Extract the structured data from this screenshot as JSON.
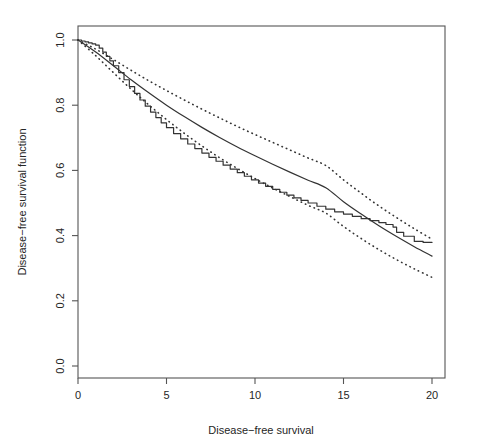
{
  "figure": {
    "title": "",
    "background_color": "#ffffff",
    "foreground_color": "#1a1a1a"
  },
  "axes": {
    "x_title": "Disease−free survival",
    "y_title": "Disease−free survival function",
    "x_ticks": [
      "0",
      "5",
      "10",
      "15",
      "20"
    ],
    "y_ticks": [
      "0.0",
      "0.2",
      "0.4",
      "0.6",
      "0.8",
      "1.0"
    ]
  },
  "chart_data": {
    "type": "line",
    "title": "",
    "xlabel": "Disease−free survival",
    "ylabel": "Disease−free survival function",
    "xlim": [
      0,
      20
    ],
    "ylim": [
      0.0,
      1.0
    ],
    "xticks": [
      0,
      5,
      10,
      15,
      20
    ],
    "yticks": [
      0.0,
      0.2,
      0.4,
      0.6,
      0.8,
      1.0
    ],
    "grid": false,
    "legend": "none",
    "box": true,
    "series": [
      {
        "name": "Kaplan-Meier empirical survival",
        "style": "solid-step",
        "color": "#333333",
        "x": [
          0.0,
          0.2,
          0.4,
          0.6,
          0.8,
          1.0,
          1.2,
          1.4,
          1.6,
          1.8,
          2.0,
          2.3,
          2.6,
          2.9,
          3.2,
          3.5,
          3.8,
          4.1,
          4.4,
          4.7,
          5.0,
          5.4,
          5.8,
          6.2,
          6.6,
          7.0,
          7.4,
          7.8,
          8.2,
          8.6,
          9.0,
          9.4,
          9.8,
          10.2,
          10.6,
          11.0,
          11.4,
          11.8,
          12.2,
          12.6,
          13.0,
          13.5,
          14.0,
          14.5,
          15.0,
          15.5,
          16.0,
          16.5,
          17.0,
          17.4,
          17.8,
          18.0,
          18.4,
          19.0,
          19.5,
          20.0
        ],
        "y": [
          1.0,
          0.997,
          0.994,
          0.991,
          0.988,
          0.984,
          0.975,
          0.963,
          0.95,
          0.936,
          0.921,
          0.9,
          0.878,
          0.857,
          0.836,
          0.816,
          0.797,
          0.779,
          0.762,
          0.746,
          0.731,
          0.713,
          0.697,
          0.681,
          0.667,
          0.653,
          0.64,
          0.628,
          0.616,
          0.604,
          0.593,
          0.582,
          0.571,
          0.561,
          0.551,
          0.542,
          0.533,
          0.524,
          0.516,
          0.508,
          0.5,
          0.49,
          0.481,
          0.473,
          0.466,
          0.459,
          0.452,
          0.446,
          0.44,
          0.434,
          0.426,
          0.41,
          0.398,
          0.382,
          0.379,
          0.379
        ]
      },
      {
        "name": "Fitted model survival",
        "style": "solid-smooth",
        "color": "#333333",
        "x": [
          0,
          1,
          2,
          3,
          4,
          5,
          6,
          7,
          8,
          9,
          10,
          11,
          12,
          13,
          14,
          15,
          16,
          17,
          18,
          19,
          20
        ],
        "y": [
          1.0,
          0.963,
          0.921,
          0.878,
          0.838,
          0.8,
          0.765,
          0.732,
          0.701,
          0.672,
          0.645,
          0.619,
          0.594,
          0.57,
          0.547,
          0.504,
          0.466,
          0.43,
          0.397,
          0.366,
          0.337
        ]
      },
      {
        "name": "Upper confidence band",
        "style": "dotted",
        "color": "#333333",
        "x": [
          0,
          1,
          2,
          3,
          4,
          5,
          6,
          7,
          8,
          9,
          10,
          11,
          12,
          13,
          14,
          15,
          16,
          17,
          18,
          19,
          20
        ],
        "y": [
          1.0,
          0.972,
          0.94,
          0.907,
          0.875,
          0.845,
          0.816,
          0.788,
          0.761,
          0.735,
          0.71,
          0.686,
          0.662,
          0.638,
          0.615,
          0.571,
          0.53,
          0.491,
          0.455,
          0.421,
          0.389
        ]
      },
      {
        "name": "Lower confidence band",
        "style": "dotted",
        "color": "#333333",
        "x": [
          0,
          1,
          2,
          3,
          4,
          5,
          6,
          7,
          8,
          9,
          10,
          11,
          12,
          13,
          14,
          15,
          16,
          17,
          18,
          19,
          20
        ],
        "y": [
          1.0,
          0.952,
          0.9,
          0.849,
          0.801,
          0.756,
          0.714,
          0.675,
          0.639,
          0.606,
          0.575,
          0.546,
          0.519,
          0.493,
          0.469,
          0.428,
          0.391,
          0.357,
          0.326,
          0.298,
          0.272
        ]
      }
    ]
  }
}
